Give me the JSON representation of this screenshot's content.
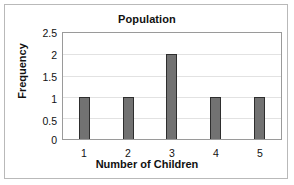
{
  "chart_data": {
    "type": "bar",
    "title": "Population",
    "xlabel": "Number of Children",
    "ylabel": "Frequency",
    "categories": [
      "1",
      "2",
      "3",
      "4",
      "5"
    ],
    "values": [
      1,
      1,
      2,
      1,
      1
    ],
    "ylim": [
      0,
      2.5
    ],
    "ytick_labels": [
      "2.5",
      "2",
      "1.5",
      "1",
      "0.5",
      "0"
    ],
    "ytick_values": [
      2.5,
      2,
      1.5,
      1,
      0.5,
      0
    ],
    "grid": true,
    "legend": false,
    "bar_color": "#727272",
    "bar_border_color": "#2e2e2e",
    "gridline_color": "#e2e2e2",
    "plot_border_color": "#9a9a9a",
    "frame_border_color": "#b9b9b9",
    "background_color": "#ffffff"
  }
}
